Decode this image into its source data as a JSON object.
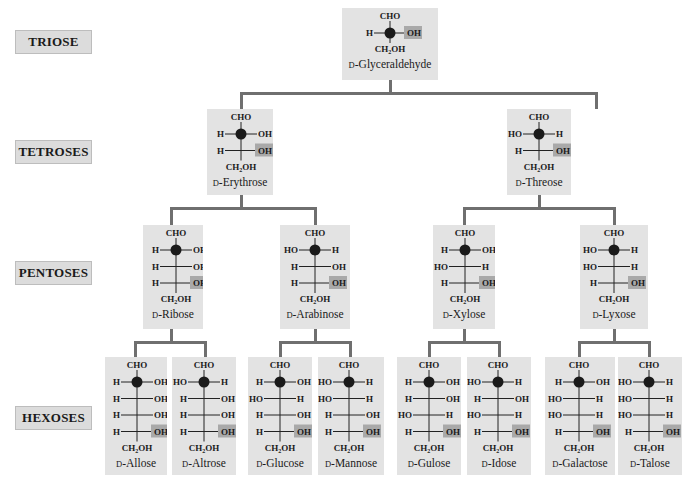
{
  "row_labels": {
    "triose": "TRIOSE",
    "tetroses": "TETROSES",
    "pentoses": "PENTOSES",
    "hexoses": "HEXOSES"
  },
  "colors": {
    "box_fill": "#e3e3e3",
    "label_fill": "#dcdcdc",
    "highlight_fill": "#a9a9a9",
    "connector": "#6f6f6f",
    "chiral_dot": "#1a1a1a"
  },
  "common": {
    "top_group": "CHO",
    "bottom_group": "CH₂OH",
    "d_prefix": "D"
  },
  "sugars": {
    "glyceraldehyde": {
      "name": "-Glyceraldehyde",
      "rows": [
        [
          "H",
          "OH"
        ]
      ]
    },
    "erythrose": {
      "name": "-Erythrose",
      "rows": [
        [
          "H",
          "OH"
        ],
        [
          "H",
          "OH"
        ]
      ]
    },
    "threose": {
      "name": "-Threose",
      "rows": [
        [
          "HO",
          "H"
        ],
        [
          "H",
          "OH"
        ]
      ]
    },
    "ribose": {
      "name": "-Ribose",
      "rows": [
        [
          "H",
          "OH"
        ],
        [
          "H",
          "OH"
        ],
        [
          "H",
          "OH"
        ]
      ]
    },
    "arabinose": {
      "name": "-Arabinose",
      "rows": [
        [
          "HO",
          "H"
        ],
        [
          "H",
          "OH"
        ],
        [
          "H",
          "OH"
        ]
      ]
    },
    "xylose": {
      "name": "-Xylose",
      "rows": [
        [
          "H",
          "OH"
        ],
        [
          "HO",
          "H"
        ],
        [
          "H",
          "OH"
        ]
      ]
    },
    "lyxose": {
      "name": "-Lyxose",
      "rows": [
        [
          "HO",
          "H"
        ],
        [
          "HO",
          "H"
        ],
        [
          "H",
          "OH"
        ]
      ]
    },
    "allose": {
      "name": "-Allose",
      "rows": [
        [
          "H",
          "OH"
        ],
        [
          "H",
          "OH"
        ],
        [
          "H",
          "OH"
        ],
        [
          "H",
          "OH"
        ]
      ]
    },
    "altrose": {
      "name": "-Altrose",
      "rows": [
        [
          "HO",
          "H"
        ],
        [
          "H",
          "OH"
        ],
        [
          "H",
          "OH"
        ],
        [
          "H",
          "OH"
        ]
      ]
    },
    "glucose": {
      "name": "-Glucose",
      "rows": [
        [
          "H",
          "OH"
        ],
        [
          "HO",
          "H"
        ],
        [
          "H",
          "OH"
        ],
        [
          "H",
          "OH"
        ]
      ]
    },
    "mannose": {
      "name": "-Mannose",
      "rows": [
        [
          "HO",
          "H"
        ],
        [
          "HO",
          "H"
        ],
        [
          "H",
          "OH"
        ],
        [
          "H",
          "OH"
        ]
      ]
    },
    "gulose": {
      "name": "-Gulose",
      "rows": [
        [
          "H",
          "OH"
        ],
        [
          "H",
          "OH"
        ],
        [
          "HO",
          "H"
        ],
        [
          "H",
          "OH"
        ]
      ]
    },
    "idose": {
      "name": "-Idose",
      "rows": [
        [
          "HO",
          "H"
        ],
        [
          "H",
          "OH"
        ],
        [
          "HO",
          "H"
        ],
        [
          "H",
          "OH"
        ]
      ]
    },
    "galactose": {
      "name": "-Galactose",
      "rows": [
        [
          "H",
          "OH"
        ],
        [
          "HO",
          "H"
        ],
        [
          "HO",
          "H"
        ],
        [
          "H",
          "OH"
        ]
      ]
    },
    "talose": {
      "name": "-Talose",
      "rows": [
        [
          "HO",
          "H"
        ],
        [
          "HO",
          "H"
        ],
        [
          "HO",
          "H"
        ],
        [
          "H",
          "OH"
        ]
      ]
    }
  }
}
